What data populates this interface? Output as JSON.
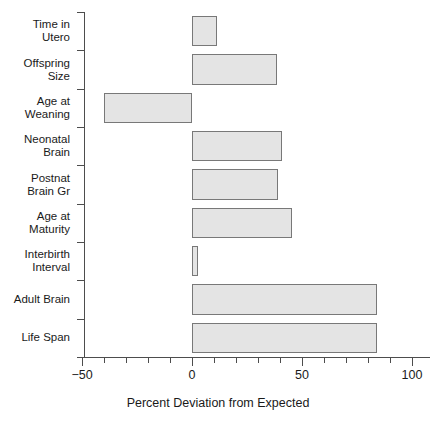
{
  "chart_data": {
    "type": "bar",
    "orientation": "horizontal",
    "title": "",
    "xlabel": "Percent Deviation from Expected",
    "ylabel": "",
    "categories": [
      "Time in\nUtero",
      "Offspring\nSize",
      "Age at\nWeaning",
      "Neonatal\nBrain",
      "Postnat\nBrain Gr",
      "Age at\nMaturity",
      "Interbirth\nInterval",
      "Adult Brain",
      "Life Span"
    ],
    "values": [
      11.5,
      38.5,
      -40,
      41,
      39,
      45.5,
      2.5,
      84,
      84
    ],
    "xlim": [
      -50,
      100
    ],
    "xticks": [
      -50,
      0,
      50,
      100
    ],
    "xtick_labels": [
      "−50",
      "0",
      "50",
      "100"
    ],
    "xticks_minor": [
      -40,
      -30,
      -20,
      -10,
      10,
      20,
      30,
      40,
      60,
      70,
      80,
      90
    ],
    "grid": false,
    "legend": null,
    "bar_fill_color": "#e4e4e4",
    "bar_border_color": "#787878",
    "axis_color": "#4d4d4d",
    "text_color": "#1a1a1a"
  }
}
